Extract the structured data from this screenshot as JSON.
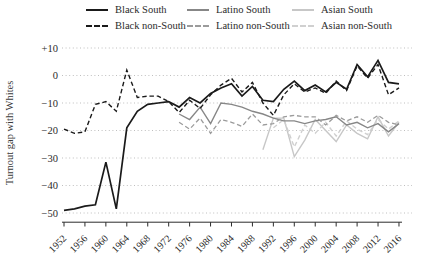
{
  "figure": {
    "y_axis_title": "Turnout gap with Whites"
  },
  "colors": {
    "black_series": "#1a1a1a",
    "latino_series": "#878787",
    "latino_nonsouth_series": "#9b9b9b",
    "asian_series": "#c7c7c7",
    "asian_nonsouth_series": "#d0d0d0",
    "grid": "#b8b8b8",
    "axis": "#2b2b2b",
    "text": "#2b2b2b"
  },
  "legend": {
    "items": [
      {
        "label": "Black South",
        "style": "solid",
        "color": "#1a1a1a"
      },
      {
        "label": "Latino South",
        "style": "solid",
        "color": "#878787"
      },
      {
        "label": "Asian South",
        "style": "solid",
        "color": "#c7c7c7"
      },
      {
        "label": "Black non-South",
        "style": "dashed",
        "color": "#1a1a1a"
      },
      {
        "label": "Latino non-South",
        "style": "dashed",
        "color": "#9b9b9b"
      },
      {
        "label": "Asian non-South",
        "style": "dashed",
        "color": "#d0d0d0"
      }
    ]
  },
  "chart_data": {
    "type": "line",
    "title": "",
    "xlabel": "",
    "ylabel": "Turnout gap with Whites",
    "xlim": [
      1952,
      2016
    ],
    "ylim": [
      -52,
      12
    ],
    "grid": "dotted horizontal gridlines at each y tick",
    "legend_position": "top",
    "x_ticks": [
      1952,
      1956,
      1960,
      1964,
      1968,
      1972,
      1976,
      1980,
      1984,
      1988,
      1992,
      1996,
      2000,
      2004,
      2008,
      2012,
      2016
    ],
    "y_ticks": [
      {
        "label": "+10",
        "value": 10
      },
      {
        "label": "0",
        "value": 0
      },
      {
        "label": "−10",
        "value": -10
      },
      {
        "label": "−20",
        "value": -20
      },
      {
        "label": "−30",
        "value": -30
      },
      {
        "label": "−40",
        "value": -40
      },
      {
        "label": "−50",
        "value": -50
      }
    ],
    "series": [
      {
        "name": "Asian South",
        "style": "solid",
        "color": "#c7c7c7",
        "width": 1.4,
        "x": [
          1990,
          1992,
          1994,
          1996,
          1998,
          2000,
          2002,
          2004,
          2006,
          2008,
          2010,
          2012,
          2014,
          2016
        ],
        "y": [
          -27,
          -15.5,
          -15.5,
          -29.5,
          -23.5,
          -16,
          -20,
          -24,
          -18,
          -21,
          -23,
          -15,
          -22,
          -17
        ]
      },
      {
        "name": "Asian non-South",
        "style": "dashed",
        "color": "#d0d0d0",
        "width": 1.4,
        "x": [
          1992,
          1994,
          1996,
          1998,
          2000,
          2002,
          2004,
          2006,
          2008,
          2010,
          2012,
          2014,
          2016
        ],
        "y": [
          -19,
          -16,
          -26,
          -18,
          -21,
          -17,
          -22,
          -16.5,
          -19.5,
          -21.5,
          -16,
          -19.5,
          -16.5
        ]
      },
      {
        "name": "Latino South",
        "style": "solid",
        "color": "#878787",
        "width": 1.4,
        "x": [
          1974,
          1976,
          1978,
          1980,
          1982,
          1984,
          1986,
          1988,
          1990,
          1992,
          1994,
          1996,
          1998,
          2000,
          2002,
          2004,
          2006,
          2008,
          2010,
          2012,
          2014,
          2016
        ],
        "y": [
          -14,
          -16,
          -11.5,
          -17.5,
          -10,
          -10.5,
          -11.5,
          -13,
          -14,
          -15.5,
          -16.5,
          -16.5,
          -17.5,
          -16.5,
          -16,
          -15,
          -18,
          -17,
          -19,
          -17.5,
          -20.5,
          -17.5
        ]
      },
      {
        "name": "Latino non-South",
        "style": "dashed",
        "color": "#9b9b9b",
        "width": 1.3,
        "x": [
          1974,
          1976,
          1978,
          1980,
          1982,
          1984,
          1986,
          1988,
          1990,
          1992,
          1994,
          1996,
          1998,
          2000,
          2002,
          2004,
          2006,
          2008,
          2010,
          2012,
          2014,
          2016
        ],
        "y": [
          -17,
          -19.5,
          -15.5,
          -21,
          -16,
          -17,
          -18.5,
          -14,
          -18,
          -17.5,
          -15,
          -14.5,
          -15,
          -15,
          -18,
          -14.5,
          -16.5,
          -15,
          -17,
          -14.5,
          -17,
          -18
        ]
      },
      {
        "name": "Black non-South",
        "style": "dashed",
        "color": "#1a1a1a",
        "width": 1.4,
        "x": [
          1952,
          1954,
          1956,
          1958,
          1960,
          1962,
          1964,
          1966,
          1968,
          1970,
          1972,
          1974,
          1976,
          1978,
          1980,
          1982,
          1984,
          1986,
          1988,
          1990,
          1992,
          1994,
          1996,
          1998,
          2000,
          2002,
          2004,
          2006,
          2008,
          2010,
          2012,
          2014,
          2016
        ],
        "y": [
          -19.5,
          -21,
          -20.5,
          -10.5,
          -9.5,
          -13,
          2,
          -8,
          -7.5,
          -7.5,
          -9.5,
          -13.5,
          -9,
          -12,
          -7,
          -3.5,
          -1,
          -6,
          -2.5,
          -10,
          -14.5,
          -7,
          -3,
          -6,
          -4.5,
          -6.5,
          -2,
          -5.5,
          3.5,
          -1,
          4,
          -7,
          -4.5
        ]
      },
      {
        "name": "Black South",
        "style": "solid",
        "color": "#1a1a1a",
        "width": 1.7,
        "x": [
          1952,
          1954,
          1956,
          1958,
          1960,
          1962,
          1964,
          1966,
          1968,
          1970,
          1972,
          1974,
          1976,
          1978,
          1980,
          1982,
          1984,
          1986,
          1988,
          1990,
          1992,
          1994,
          1996,
          1998,
          2000,
          2002,
          2004,
          2006,
          2008,
          2010,
          2012,
          2014,
          2016
        ],
        "y": [
          -49,
          -48.5,
          -47.5,
          -47,
          -31.5,
          -48.5,
          -19,
          -13,
          -10.5,
          -10,
          -9.5,
          -11.5,
          -8,
          -10,
          -6.5,
          -4.5,
          -3,
          -7.5,
          -4,
          -9,
          -9.5,
          -5,
          -2,
          -5.5,
          -3.5,
          -6,
          -2.5,
          -5,
          4,
          -0.5,
          5.5,
          -2.5,
          -3
        ]
      }
    ]
  }
}
